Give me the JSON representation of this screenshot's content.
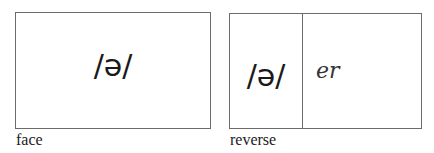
{
  "cards": {
    "face": {
      "symbol": "/ə/",
      "caption": "face"
    },
    "reverse": {
      "symbol": "/ə/",
      "spelling": "er",
      "caption": "reverse"
    }
  },
  "colors": {
    "border": "#6b6b6b",
    "text": "#1a1a1a"
  }
}
